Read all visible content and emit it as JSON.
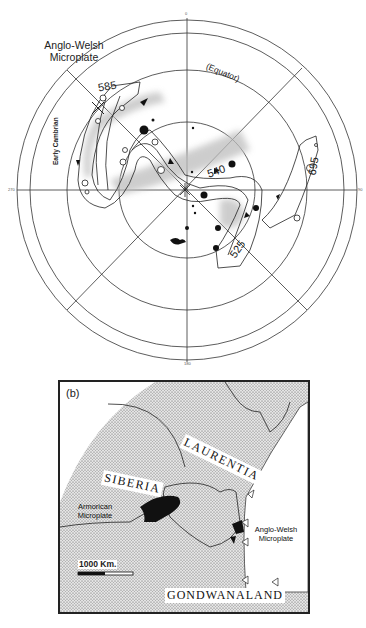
{
  "panel_a": {
    "plate_label_line1": "Anglo-Welsh",
    "plate_label_line2": "Microplate",
    "equator_label": "(Equator)",
    "early_cambrian_label": "Early Cambrian",
    "age_labels": [
      "585",
      "540",
      "525",
      "695"
    ],
    "axis_labels": {
      "top": "0",
      "right": "90",
      "bottom": "180",
      "left": "270"
    },
    "point_labels": [
      "1",
      "2",
      "3",
      "4",
      "5",
      "6",
      "7",
      "8",
      "9",
      "10",
      "11",
      "12",
      "13",
      "14",
      "15",
      "16",
      "17",
      "18",
      "19",
      "20",
      "21",
      "22",
      "23",
      "24",
      "25"
    ]
  },
  "panel_b": {
    "panel_label": "(b)",
    "labels": {
      "laurentia": "LAURENTIA",
      "siberia": "SIBERIA",
      "armorican_line1": "Armorican",
      "armorican_line2": "Microplate",
      "anglo_welsh_line1": "Anglo-Welsh",
      "anglo_welsh_line2": "Microplate",
      "gondwanaland": "GONDWANALAND"
    },
    "scale_bar": "1000 Km."
  }
}
